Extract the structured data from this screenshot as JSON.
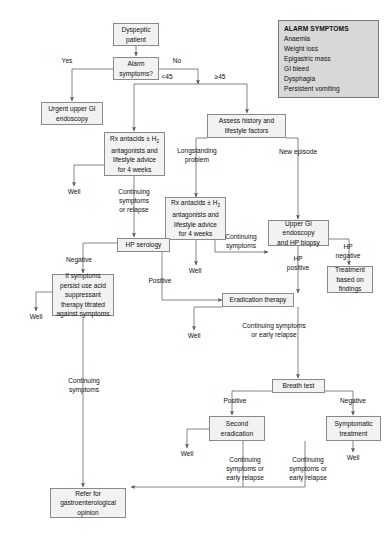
{
  "figure": {
    "type": "flowchart",
    "background": "#ffffff",
    "node_fill": "#f2f2f2",
    "node_border": "#8a8a8a",
    "alarm_fill": "#d8d8d8"
  },
  "alarm_panel": {
    "heading": "ALARM SYMPTOMS",
    "items": [
      "Anaemia",
      "Weight loss",
      "Epigastric mass",
      "GI bleed",
      "Dysphagia",
      "Persistent vomiting"
    ]
  },
  "nodes": {
    "dyspeptic_patient": "Dyspeptic\npatient",
    "alarm_symptoms": "Alarm\nsymptoms?",
    "urgent_endoscopy": "Urgent upper GI\nendoscopy",
    "rx_antacids_1_line1": "Rx antacids ± H",
    "rx_antacids_1_sub": "2",
    "rx_antacids_1_rest": "antagonists and\nlifestyle advice\nfor 4 weeks",
    "assess_history": "Assess history and\nlifestyle factors",
    "rx_antacids_2_line1": "Rx antacids ± H",
    "rx_antacids_2_sub": "2",
    "rx_antacids_2_rest": "antagonists and\nlifestyle advice\nfor 4 weeks",
    "hp_serology": "HP serology",
    "upper_gi_endoscopy": "Upper GI\nendoscopy\nand HP biopsy",
    "treatment_findings": "Treatment\nbased on\nfindings",
    "acid_suppressant": "If symptoms\npersist use acid\nsuppressant\ntherapy titrated\nagainst symptoms",
    "eradication_therapy": "Eradication therapy",
    "breath_test": "Breath test",
    "second_eradication": "Second\neradication",
    "symptomatic_treatment": "Symptomatic\ntreatment",
    "refer_gastro": "Refer for\ngastroenterological\nopinion"
  },
  "edge_labels": {
    "yes": "Yes",
    "no": "No",
    "under45": "<45",
    "over45": "≥45",
    "longstanding": "Longstanding\nproblem",
    "new_episode": "New episode",
    "well_1": "Well",
    "well_2": "Well",
    "well_3": "Well",
    "well_4": "Well",
    "well_5": "Well",
    "well_6": "Well",
    "well_7": "Well",
    "continuing_relapse": "Continuing\nsymptoms\nor relapse",
    "continuing_symptoms": "Continuing\nsymptoms",
    "negative_serology": "Negative",
    "positive_serology": "Positive",
    "hp_positive": "HP\npositive",
    "hp_negative": "HP\nnegative",
    "continuing_early_relapse_1": "Continuing symptoms\nor early relapse",
    "continuing_symptoms_2": "Continuing\nsymptoms",
    "breath_positive": "Positive",
    "breath_negative": "Negative",
    "continuing_early_relapse_2": "Continuing\nsymptoms or\nearly relapse",
    "continuing_early_relapse_3": "Continuing\nsymptoms or\nearly relapse"
  }
}
